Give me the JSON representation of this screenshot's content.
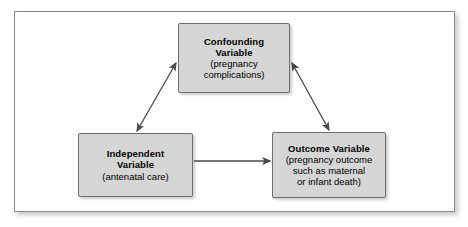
{
  "diagram": {
    "type": "confounding-variable-triangle",
    "frame": {
      "border_color": "#8b8b8b",
      "background_color": "#ffffff"
    },
    "node_style": {
      "fill_color": "#d6d6d6",
      "border_color": "#6e6e6e",
      "text_color": "#000000"
    },
    "arrow_color": "#4a4a4a",
    "nodes": [
      {
        "id": "confounding",
        "title_line_1": "Confounding",
        "title_line_2": "Variable",
        "sub_line_1": "(pregnancy",
        "sub_line_2": "complications)"
      },
      {
        "id": "independent",
        "title_line_1": "Independent",
        "title_line_2": "Variable",
        "sub_line_1": "(antenatal care)",
        "sub_line_2": ""
      },
      {
        "id": "outcome",
        "title_line_1": "Outcome Variable",
        "title_line_2": "",
        "sub_line_1": "(pregnancy outcome",
        "sub_line_2": "such as maternal",
        "sub_line_3": "or infant death)"
      }
    ],
    "connections": [
      {
        "id": "independent-to-outcome",
        "from": "independent",
        "to": "outcome",
        "heads": "single",
        "direction": "right"
      },
      {
        "id": "confounding-independent",
        "from": "confounding",
        "to": "independent",
        "heads": "double",
        "direction": "diagonal-down-left"
      },
      {
        "id": "confounding-outcome",
        "from": "confounding",
        "to": "outcome",
        "heads": "double",
        "direction": "diagonal-down-right"
      }
    ]
  }
}
